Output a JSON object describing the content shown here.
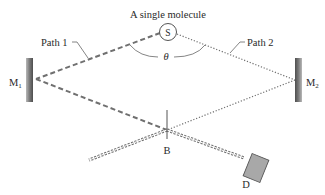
{
  "diagram": {
    "title": "A single molecule",
    "source": {
      "label": "S"
    },
    "paths": [
      {
        "id": "path1",
        "label": "Path 1",
        "style": "dashed"
      },
      {
        "id": "path2",
        "label": "Path 2",
        "style": "dotted"
      }
    ],
    "angle": {
      "label": "θ"
    },
    "mirrors": [
      {
        "id": "m1",
        "label": "M",
        "subscript": "1"
      },
      {
        "id": "m2",
        "label": "M",
        "subscript": "2"
      }
    ],
    "beam_splitter": {
      "label": "B"
    },
    "detector": {
      "label": "D"
    },
    "colors": {
      "line": "#707070",
      "mirror_dark": "#5a5a5a",
      "mirror_light": "#b8b8b8",
      "detector_fill": "#a8a8a8",
      "text": "#2a2a2a"
    }
  }
}
